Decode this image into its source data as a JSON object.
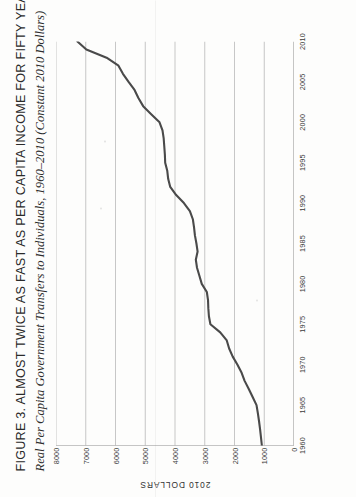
{
  "figure": {
    "label": "Figure 3.",
    "title": "Almost Twice as Fast as Per Capita Income for Fifty Years",
    "title_full": "Figure 3. Almost Twice as Fast as Per Capita Income for Fifty Years",
    "subtitle": "Real Per Capita Government Transfers to Individuals, 1960–2010 (Constant 2010 Dollars)"
  },
  "chart_data": {
    "type": "line",
    "title": "Figure 3. Almost Twice as Fast as Per Capita Income for Fifty Years",
    "subtitle": "Real Per Capita Government Transfers to Individuals, 1960–2010 (Constant 2010 Dollars)",
    "xlabel": "",
    "ylabel": "2010 Dollars",
    "xlim": [
      1960,
      2010
    ],
    "ylim": [
      0,
      8000
    ],
    "grid": "vertical-gridlines-at-y-ticks",
    "legend": "none",
    "xticks": [
      1960,
      1965,
      1970,
      1975,
      1980,
      1985,
      1990,
      1995,
      2000,
      2005,
      2010
    ],
    "xticklabels": [
      "1960",
      "1965",
      "1970",
      "1975",
      "1980",
      "1985",
      "1990",
      "1995",
      "2000",
      "2005",
      "2010"
    ],
    "yticks": [
      0,
      1000,
      2000,
      3000,
      4000,
      5000,
      6000,
      7000,
      8000
    ],
    "yticklabels": [
      "0",
      "1000",
      "2000",
      "3000",
      "4000",
      "5000",
      "6000",
      "7000",
      "8000"
    ],
    "series": [
      {
        "name": "Real Per Capita Government Transfers to Individuals",
        "color": "#4a4a4a",
        "x": [
          1960,
          1961,
          1962,
          1963,
          1964,
          1965,
          1966,
          1967,
          1968,
          1969,
          1970,
          1971,
          1972,
          1973,
          1974,
          1975,
          1976,
          1977,
          1978,
          1979,
          1980,
          1981,
          1982,
          1983,
          1984,
          1985,
          1986,
          1987,
          1988,
          1989,
          1990,
          1991,
          1992,
          1993,
          1994,
          1995,
          1996,
          1997,
          1998,
          1999,
          2000,
          2001,
          2002,
          2003,
          2004,
          2005,
          2006,
          2007,
          2008,
          2009,
          2010
        ],
        "values": [
          1080,
          1110,
          1140,
          1175,
          1215,
          1260,
          1390,
          1520,
          1660,
          1760,
          1900,
          2060,
          2180,
          2260,
          2480,
          2810,
          2860,
          2880,
          2890,
          2930,
          3100,
          3180,
          3260,
          3300,
          3240,
          3280,
          3330,
          3360,
          3400,
          3500,
          3700,
          3960,
          4160,
          4230,
          4260,
          4330,
          4340,
          4360,
          4380,
          4420,
          4520,
          4800,
          5070,
          5230,
          5360,
          5560,
          5750,
          5900,
          6300,
          6980,
          7280
        ]
      }
    ]
  },
  "axes": {
    "y_axis_title": "2010 Dollars"
  }
}
